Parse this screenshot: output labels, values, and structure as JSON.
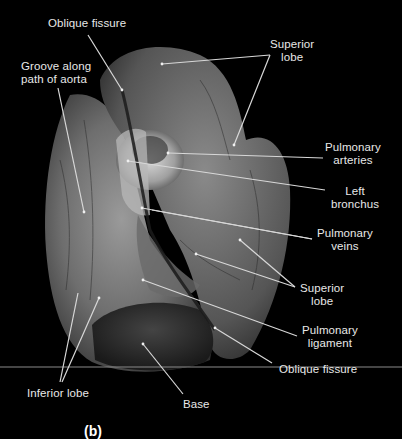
{
  "figure": {
    "panel_letter": "(b)",
    "background": "#000000",
    "label_color": "#e8e8e8",
    "leader_color": "#d8d8d8"
  },
  "labels": {
    "oblique_fissure_top": "Oblique fissure",
    "groove_aorta_line1": "Groove along",
    "groove_aorta_line2": "path of aorta",
    "superior_lobe_top_line1": "Superior",
    "superior_lobe_top_line2": "lobe",
    "pulmonary_arteries_line1": "Pulmonary",
    "pulmonary_arteries_line2": "arteries",
    "left_bronchus_line1": "Left",
    "left_bronchus_line2": "bronchus",
    "pulmonary_veins_line1": "Pulmonary",
    "pulmonary_veins_line2": "veins",
    "superior_lobe_mid_line1": "Superior",
    "superior_lobe_mid_line2": "lobe",
    "pulmonary_ligament_line1": "Pulmonary",
    "pulmonary_ligament_line2": "ligament",
    "oblique_fissure_bottom": "Oblique fissure",
    "inferior_lobe": "Inferior lobe",
    "base": "Base"
  },
  "leaders": [
    {
      "name": "oblique-fissure-top",
      "from": [
        88,
        35
      ],
      "to": [
        122,
        90
      ]
    },
    {
      "name": "groove-aorta",
      "from": [
        58,
        88
      ],
      "to": [
        84,
        212
      ]
    },
    {
      "name": "superior-lobe-top-a",
      "from": [
        270,
        55
      ],
      "to": [
        162,
        64
      ]
    },
    {
      "name": "superior-lobe-top-b",
      "from": [
        270,
        55
      ],
      "to": [
        234,
        145
      ]
    },
    {
      "name": "pulmonary-arteries",
      "from": [
        323,
        158
      ],
      "to": [
        168,
        153
      ]
    },
    {
      "name": "left-bronchus",
      "from": [
        325,
        190
      ],
      "to": [
        128,
        161
      ]
    },
    {
      "name": "pulmonary-veins-a",
      "from": [
        312,
        239
      ],
      "to": [
        142,
        208
      ]
    },
    {
      "name": "pulmonary-veins-b",
      "from": [
        312,
        239
      ],
      "to": [
        152,
        210
      ]
    },
    {
      "name": "superior-lobe-mid-a",
      "from": [
        295,
        287
      ],
      "to": [
        196,
        254
      ]
    },
    {
      "name": "superior-lobe-mid-b",
      "from": [
        295,
        287
      ],
      "to": [
        240,
        240
      ]
    },
    {
      "name": "pulmonary-ligament",
      "from": [
        297,
        336
      ],
      "to": [
        143,
        280
      ]
    },
    {
      "name": "oblique-fissure-bottom",
      "from": [
        272,
        363
      ],
      "to": [
        215,
        328
      ]
    },
    {
      "name": "inferior-lobe-a",
      "from": [
        60,
        382
      ],
      "to": [
        78,
        293
      ]
    },
    {
      "name": "inferior-lobe-b",
      "from": [
        62,
        382
      ],
      "to": [
        99,
        298
      ]
    },
    {
      "name": "base",
      "from": [
        183,
        394
      ],
      "to": [
        143,
        344
      ]
    }
  ],
  "baseline": {
    "y": 367,
    "x1": 0,
    "x2": 402
  }
}
